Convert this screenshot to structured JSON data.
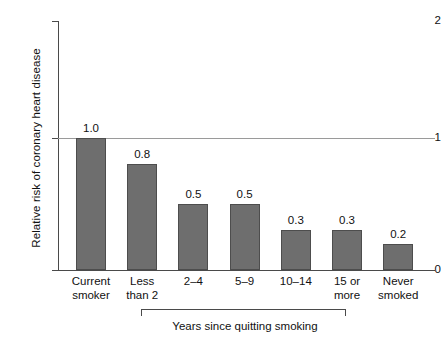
{
  "chart_data": {
    "type": "bar",
    "title": "",
    "xlabel": "Years since quitting smoking",
    "ylabel": "Relative risk of coronary heart disease",
    "categories": [
      "Current smoker",
      "Less than 2",
      "2–4",
      "5–9",
      "10–14",
      "15 or more",
      "Never smoked"
    ],
    "values": [
      1.0,
      0.8,
      0.5,
      0.5,
      0.3,
      0.3,
      0.2
    ],
    "value_labels": [
      "1.0",
      "0.8",
      "0.5",
      "0.5",
      "0.3",
      "0.3",
      "0.2"
    ],
    "ylim": [
      0,
      2
    ],
    "ytick_labels": [
      "0",
      "1",
      "2"
    ],
    "ytick_values": [
      0,
      1,
      2
    ],
    "grid": "horizontal gridline at y = 1 only",
    "legend": "none",
    "bar_color": "#6e6e6e",
    "bar_edge_color": "#4d4d4d",
    "axis_color": "#4a4a4a",
    "gridline_color": "#9a9a9a",
    "background": "#ffffff",
    "bracket_note": "Years since quitting smoking bracket spans categories 2 through 6 (Less than 2 … 15 or more)"
  },
  "axis": {
    "y_title": "Relative risk of coronary heart disease",
    "ticks": {
      "top": "2",
      "mid": "1",
      "bottom": "0"
    }
  },
  "categories": [
    {
      "line1": "Current",
      "line2": "smoker",
      "value": "1.0"
    },
    {
      "line1": "Less",
      "line2": "than 2",
      "value": "0.8"
    },
    {
      "line1": "2–4",
      "line2": "",
      "value": "0.5"
    },
    {
      "line1": "5–9",
      "line2": "",
      "value": "0.5"
    },
    {
      "line1": "10–14",
      "line2": "",
      "value": "0.3"
    },
    {
      "line1": "15 or",
      "line2": "more",
      "value": "0.3"
    },
    {
      "line1": "Never",
      "line2": "smoked",
      "value": "0.2"
    }
  ],
  "bracket": {
    "label": "Years since quitting smoking"
  }
}
